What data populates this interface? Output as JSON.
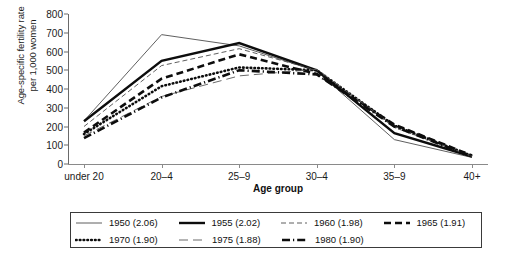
{
  "chart_data": {
    "type": "line",
    "title": "",
    "xlabel": "Age group",
    "ylabel": "Age-specific fertility rate\nper 1,000 women",
    "categories": [
      "under 20",
      "20–4",
      "25–9",
      "30–4",
      "35–9",
      "40+"
    ],
    "ylim": [
      0,
      800
    ],
    "yticks": [
      0,
      100,
      200,
      300,
      400,
      500,
      600,
      700,
      800
    ],
    "grid": false,
    "legend_position": "bottom",
    "series": [
      {
        "name": "1950 (2.06)",
        "style": "solid-thin",
        "values": [
          230,
          690,
          630,
          495,
          130,
          35
        ]
      },
      {
        "name": "1955 (2.02)",
        "style": "solid-thick",
        "values": [
          228,
          550,
          645,
          500,
          165,
          40
        ]
      },
      {
        "name": "1960 (1.98)",
        "style": "dashed-thin",
        "values": [
          200,
          525,
          615,
          500,
          195,
          42
        ]
      },
      {
        "name": "1965 (1.91)",
        "style": "dashed-thick",
        "values": [
          168,
          455,
          585,
          480,
          210,
          45
        ]
      },
      {
        "name": "1970 (1.90)",
        "style": "dotted-thick",
        "values": [
          160,
          415,
          515,
          500,
          205,
          43
        ]
      },
      {
        "name": "1975 (1.88)",
        "style": "dashed-long",
        "values": [
          150,
          360,
          470,
          505,
          200,
          41
        ]
      },
      {
        "name": "1980 (1.90)",
        "style": "dashdot-thick",
        "values": [
          138,
          355,
          500,
          478,
          200,
          40
        ]
      }
    ]
  },
  "legend": {
    "entries": [
      {
        "label": "1950 (2.06)",
        "swatch": "line-solid-thin"
      },
      {
        "label": "1955 (2.02)",
        "swatch": "line-solid-thick"
      },
      {
        "label": "1960 (1.98)",
        "swatch": "line-dashed-thin"
      },
      {
        "label": "1965 (1.91)",
        "swatch": "line-dashed-thick"
      },
      {
        "label": "1970 (1.90)",
        "swatch": "line-dotted-thick"
      },
      {
        "label": "1975 (1.88)",
        "swatch": "line-dashed-long"
      },
      {
        "label": "1980 (1.90)",
        "swatch": "line-dashdot-thick"
      }
    ]
  },
  "colors": {
    "line": "#111111",
    "thin_line": "#555555",
    "axis": "#6a6a6a",
    "text": "#1a1a1a",
    "background": "#ffffff"
  }
}
